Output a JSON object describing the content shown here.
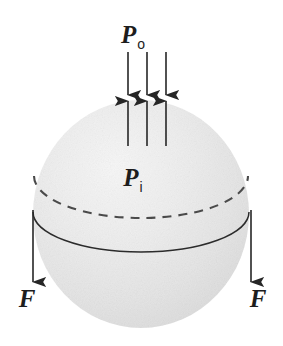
{
  "figure": {
    "background_color": "#ffffff",
    "width": 283,
    "height": 346
  },
  "sphere": {
    "name": "sphere-body",
    "center_x": 141,
    "center_y": 214,
    "radius_x": 108,
    "radius_y": 114,
    "fill_color": "#e9e9e9",
    "highlight_color": "#f6f6f6",
    "shadow_color": "#d5d5d5"
  },
  "equator_solid": {
    "name": "equator-solid-ellipse",
    "center_x": 141,
    "center_y": 232,
    "radius_x": 108,
    "radius_y": 40,
    "stroke_color": "#2b2b2b",
    "style": "solid"
  },
  "equator_dashed": {
    "name": "equator-dashed-ellipse",
    "center_x": 141,
    "center_y": 176,
    "radius_x": 107,
    "radius_y": 42,
    "stroke_color": "#4a4a4a",
    "style": "dashed"
  },
  "labels": {
    "outer_pressure": {
      "symbol": "P",
      "subscript": "o",
      "full": "Po",
      "x": 133,
      "y": 43
    },
    "inner_pressure": {
      "symbol": "P",
      "subscript": "i",
      "full": "Pi",
      "x": 133,
      "y": 186
    },
    "force_left": {
      "symbol": "F",
      "x": 27,
      "y": 307
    },
    "force_right": {
      "symbol": "F",
      "x": 258,
      "y": 307
    }
  },
  "arrows": {
    "outer_pressure_down": {
      "name": "outer-pressure-arrows",
      "direction": "down",
      "count": 3,
      "x_positions": [
        128,
        147,
        166
      ],
      "y_start": 52,
      "y_end": 95,
      "color": "#262626"
    },
    "inner_pressure_up": {
      "name": "inner-pressure-arrows",
      "direction": "up",
      "count": 3,
      "x_positions": [
        128,
        147,
        166
      ],
      "y_start": 146,
      "y_end": 101,
      "color": "#262626"
    },
    "force_left": {
      "name": "force-arrow-left",
      "direction": "down",
      "x": 33,
      "y_start": 210,
      "y_end": 282,
      "color": "#262626"
    },
    "force_right": {
      "name": "force-arrow-right",
      "direction": "down",
      "x": 251,
      "y_start": 210,
      "y_end": 282,
      "color": "#262626"
    }
  }
}
